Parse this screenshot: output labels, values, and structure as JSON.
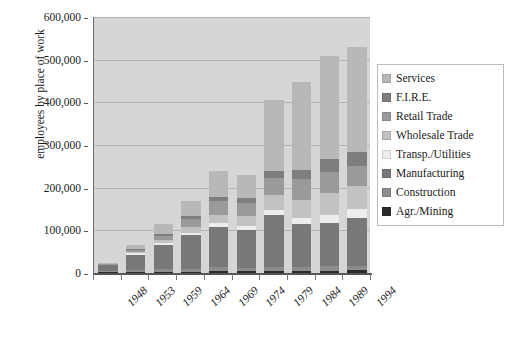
{
  "chart_data": {
    "type": "bar",
    "stacked": true,
    "title": "",
    "xlabel": "",
    "ylabel": "employees by place of work",
    "ylim": [
      0,
      600000
    ],
    "ytick_values": [
      0,
      100000,
      200000,
      300000,
      400000,
      500000,
      600000
    ],
    "ytick_labels": [
      "0",
      "100,000",
      "200,000",
      "300,000",
      "400,000",
      "500,000",
      "600,000"
    ],
    "grid": "horizontal",
    "legend_position": "right",
    "categories": [
      "1948",
      "1953",
      "1959",
      "1964",
      "1969",
      "1974",
      "1979",
      "1984",
      "1989",
      "1994"
    ],
    "series": [
      {
        "name": "Agr./Mining",
        "color": "#2b2b2b",
        "values": [
          2000,
          3000,
          3000,
          3000,
          4000,
          4000,
          5000,
          5000,
          5000,
          6000
        ]
      },
      {
        "name": "Construction",
        "color": "#8c8c8c",
        "values": [
          2000,
          4000,
          6000,
          7000,
          9000,
          8000,
          10000,
          9000,
          12000,
          10000
        ]
      },
      {
        "name": "Manufacturing",
        "color": "#787878",
        "values": [
          14000,
          36000,
          56000,
          78000,
          95000,
          90000,
          120000,
          100000,
          100000,
          113000
        ]
      },
      {
        "name": "Transp./Utilities",
        "color": "#ededed",
        "values": [
          1000,
          3000,
          5000,
          7000,
          9000,
          9000,
          12000,
          14000,
          20000,
          22000
        ]
      },
      {
        "name": "Wholesale Trade",
        "color": "#c2c2c2",
        "values": [
          1000,
          4000,
          8000,
          12000,
          18000,
          22000,
          35000,
          44000,
          51000,
          53000
        ]
      },
      {
        "name": "Retail Trade",
        "color": "#9a9a9a",
        "values": [
          1000,
          5000,
          10000,
          20000,
          35000,
          32000,
          40000,
          48000,
          50000,
          48000
        ]
      },
      {
        "name": "F.I.R.E.",
        "color": "#7e7e7e",
        "values": [
          500,
          2000,
          4000,
          6000,
          9000,
          11000,
          18000,
          22000,
          30000,
          31000
        ]
      },
      {
        "name": "Services",
        "color": "#b8b8b8",
        "values": [
          1500,
          8000,
          22000,
          37000,
          61000,
          54000,
          165000,
          205000,
          240000,
          247000
        ]
      }
    ],
    "totals": [
      23000,
      65000,
      114000,
      170000,
      240000,
      230000,
      405000,
      447000,
      508000,
      530000
    ],
    "legend_order_top_to_bottom": [
      "Services",
      "F.I.R.E.",
      "Retail Trade",
      "Wholesale Trade",
      "Transp./Utilities",
      "Manufacturing",
      "Construction",
      "Agr./Mining"
    ]
  },
  "legend": {
    "items": [
      {
        "label": "Services",
        "color": "#b8b8b8"
      },
      {
        "label": "F.I.R.E.",
        "color": "#7e7e7e"
      },
      {
        "label": "Retail Trade",
        "color": "#9a9a9a"
      },
      {
        "label": "Wholesale Trade",
        "color": "#c2c2c2"
      },
      {
        "label": "Transp./Utilities",
        "color": "#ededed"
      },
      {
        "label": "Manufacturing",
        "color": "#787878"
      },
      {
        "label": "Construction",
        "color": "#8c8c8c"
      },
      {
        "label": "Agr./Mining",
        "color": "#2b2b2b"
      }
    ]
  },
  "colors": {
    "plot_background": "#d6d6d6",
    "gridline": "#b4b4b4",
    "axis": "#555555",
    "page_background": "#ffffff",
    "text": "#1a1a1a"
  }
}
